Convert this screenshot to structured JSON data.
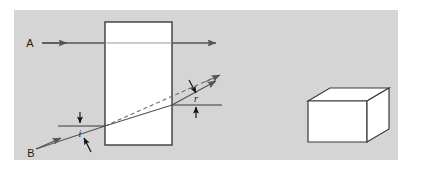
{
  "figure": {
    "panel": {
      "background_color": "#d5d5d5",
      "page_background_color": "#ffffff",
      "x": 14,
      "y": 10,
      "width": 384,
      "height": 150
    },
    "slab": {
      "name": "rectangular glass block (side view)",
      "fill_color": "#ffffff",
      "stroke_color": "#3a3a3a",
      "x": 105,
      "y": 22,
      "width": 67,
      "height": 123
    },
    "block_3d": {
      "name": "rectangular glass block (3D view)",
      "fill_top_color": "#ffffff",
      "fill_front_color": "#ffffff",
      "fill_side_color": "#ffffff",
      "stroke_color": "#3a3a3a"
    },
    "rays": [
      {
        "id": "A",
        "label": "A",
        "label_x": 30,
        "label_y": 47,
        "description": "ray entering along the normal, passes straight through undeviated",
        "color": "#555555"
      },
      {
        "id": "B",
        "label": "B",
        "label_x": 31,
        "label_y": 157,
        "description": "ray entering obliquely, refracted at both faces, emerges parallel to original direction but laterally displaced",
        "color": "#555555"
      }
    ],
    "angles": [
      {
        "id": "i",
        "label": "i",
        "label_x": 80,
        "label_y": 137,
        "description": "angle of incidence at the first face, between incident ray B and the normal",
        "color": "#1a1a1a"
      },
      {
        "id": "r",
        "label": "r",
        "label_x": 196,
        "label_y": 102,
        "description": "angle of refraction at the second face, between emergent ray and the normal",
        "color": "#1a1a1a"
      }
    ],
    "construction_lines": [
      {
        "name": "normal-at-first-face",
        "style": "solid",
        "description": "normal to the left face of the slab where ray B enters"
      },
      {
        "name": "normal-at-second-face",
        "style": "solid",
        "description": "normal to the right face of the slab where the ray emerges"
      },
      {
        "name": "undeviated-path",
        "style": "dashed",
        "description": "dashed continuation showing the original direction of ray B had it not been refracted"
      }
    ]
  }
}
